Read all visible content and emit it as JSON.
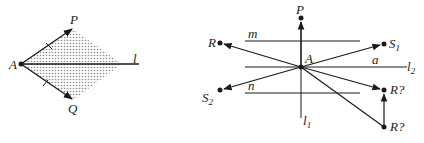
{
  "left_diagram": {
    "labels": {
      "A": "A",
      "P": "P",
      "Q": "Q",
      "l": "l"
    }
  },
  "right_diagram": {
    "labels": {
      "P": "P",
      "A": "A",
      "R": "R",
      "S1": "S",
      "S1_sub": "1",
      "S2": "S",
      "S2_sub": "2",
      "m": "m",
      "n": "n",
      "a": "a",
      "l1": "l",
      "l1_sub": "1",
      "l2": "l",
      "l2_sub": "2",
      "R_q_upper": "R?",
      "R_q_lower": "R?"
    }
  },
  "colors": {
    "ink": "#1a1a1a",
    "fill_dots": "#9a9a9a"
  }
}
